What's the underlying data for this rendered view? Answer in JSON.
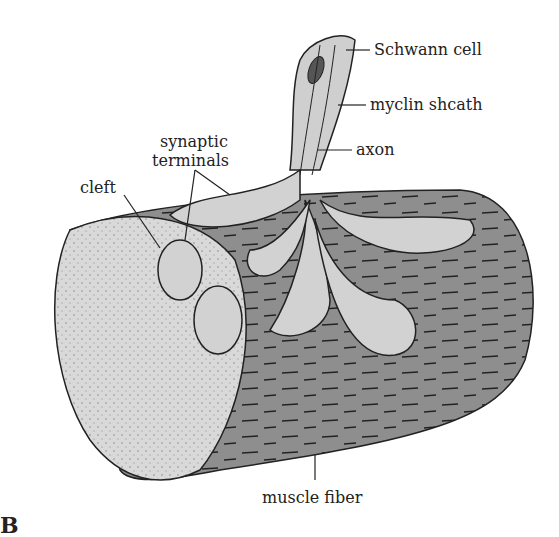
{
  "figure": {
    "panel_letter": "B",
    "labels": {
      "schwann": "Schwann cell",
      "myelin": "myclin shcath",
      "axon": "axon",
      "synaptic": "synaptic",
      "terminals": "terminals",
      "cleft": "cleft",
      "muscle": "muscle fiber"
    },
    "colors": {
      "muscle_body": "#8f8f8f",
      "muscle_end": "#d8d8d8",
      "terminal": "#d0d0d0",
      "outline": "#222222"
    }
  }
}
